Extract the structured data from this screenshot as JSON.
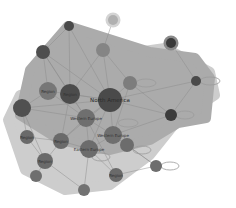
{
  "diagram": {
    "type": "network-graph",
    "colors": {
      "background": "#ffffff",
      "hull_outer": "#c9c9c9",
      "hull_inner": "#a9a9a9",
      "edge": "#8c8c8c",
      "loop": "#9a9a9a"
    },
    "hulls": [
      {
        "name": "outer-cluster",
        "points": "45,88 95,58 165,48 210,72 215,95 178,120 150,155 110,185 65,190 25,170 8,120 20,95",
        "fill": "#cdcdcd"
      },
      {
        "name": "inner-cluster",
        "points": "30,70 68,26 150,52 195,58 210,78 206,118 178,123 150,140 110,150 60,140 20,115",
        "fill": "#ababab"
      }
    ],
    "nodes": [
      {
        "id": "n1",
        "x": 113,
        "y": 20,
        "r": 5,
        "fill": "#b0b0b0",
        "ring": "#d4d4d4",
        "label": ""
      },
      {
        "id": "n2",
        "x": 171,
        "y": 43,
        "r": 5,
        "fill": "#3a3a3a",
        "ring": "#8a8a8a",
        "label": ""
      },
      {
        "id": "n3",
        "x": 69,
        "y": 26,
        "r": 5,
        "fill": "#4a4a4a",
        "ring": "",
        "label": ""
      },
      {
        "id": "n4",
        "x": 43,
        "y": 52,
        "r": 7,
        "fill": "#4e4e4e",
        "ring": "",
        "label": ""
      },
      {
        "id": "n5",
        "x": 103,
        "y": 50,
        "r": 7,
        "fill": "#858585",
        "ring": "",
        "label": ""
      },
      {
        "id": "n6",
        "x": 196,
        "y": 81,
        "r": 5,
        "fill": "#4a4a4a",
        "ring": "",
        "label": ""
      },
      {
        "id": "n7",
        "x": 48,
        "y": 91,
        "r": 9,
        "fill": "#777777",
        "ring": "",
        "label": "Region"
      },
      {
        "id": "n8",
        "x": 70,
        "y": 94,
        "r": 10,
        "fill": "#4c4c4c",
        "ring": "",
        "label": "Region"
      },
      {
        "id": "n9",
        "x": 110,
        "y": 100,
        "r": 12,
        "fill": "#4a4a4a",
        "ring": "",
        "label": "North America"
      },
      {
        "id": "n10",
        "x": 130,
        "y": 83,
        "r": 7,
        "fill": "#7d7d7d",
        "ring": "",
        "label": ""
      },
      {
        "id": "n11",
        "x": 171,
        "y": 115,
        "r": 6,
        "fill": "#3c3c3c",
        "ring": "",
        "label": ""
      },
      {
        "id": "n12",
        "x": 22,
        "y": 108,
        "r": 9,
        "fill": "#505050",
        "ring": "",
        "label": ""
      },
      {
        "id": "n13",
        "x": 86,
        "y": 118,
        "r": 9,
        "fill": "#6f6f6f",
        "ring": "",
        "label": "Western Europe"
      },
      {
        "id": "n14",
        "x": 113,
        "y": 135,
        "r": 9,
        "fill": "#6f6f6f",
        "ring": "",
        "label": "Western Europe"
      },
      {
        "id": "n15",
        "x": 27,
        "y": 137,
        "r": 7,
        "fill": "#6a6a6a",
        "ring": "",
        "label": "Region"
      },
      {
        "id": "n16",
        "x": 61,
        "y": 141,
        "r": 8,
        "fill": "#6a6a6a",
        "ring": "",
        "label": "Region"
      },
      {
        "id": "n17",
        "x": 89,
        "y": 149,
        "r": 9,
        "fill": "#6c6c6c",
        "ring": "",
        "label": "Eastern Europe"
      },
      {
        "id": "n18",
        "x": 45,
        "y": 161,
        "r": 8,
        "fill": "#6a6a6a",
        "ring": "",
        "label": "Region"
      },
      {
        "id": "n19",
        "x": 116,
        "y": 175,
        "r": 7,
        "fill": "#6a6a6a",
        "ring": "",
        "label": "Region"
      },
      {
        "id": "n20",
        "x": 156,
        "y": 166,
        "r": 6,
        "fill": "#6e6e6e",
        "ring": "",
        "label": ""
      },
      {
        "id": "n21",
        "x": 127,
        "y": 145,
        "r": 7,
        "fill": "#6c6c6c",
        "ring": "",
        "label": ""
      },
      {
        "id": "n22",
        "x": 84,
        "y": 190,
        "r": 6,
        "fill": "#727272",
        "ring": "",
        "label": ""
      },
      {
        "id": "n23",
        "x": 36,
        "y": 176,
        "r": 6,
        "fill": "#6f6f6f",
        "ring": "",
        "label": ""
      }
    ],
    "edges": [
      [
        "n1",
        "n5"
      ],
      [
        "n2",
        "n6"
      ],
      [
        "n3",
        "n4"
      ],
      [
        "n3",
        "n8"
      ],
      [
        "n4",
        "n7"
      ],
      [
        "n4",
        "n8"
      ],
      [
        "n4",
        "n9"
      ],
      [
        "n5",
        "n9"
      ],
      [
        "n5",
        "n10"
      ],
      [
        "n5",
        "n8"
      ],
      [
        "n6",
        "n9"
      ],
      [
        "n6",
        "n11"
      ],
      [
        "n7",
        "n9"
      ],
      [
        "n7",
        "n13"
      ],
      [
        "n8",
        "n9"
      ],
      [
        "n8",
        "n13"
      ],
      [
        "n9",
        "n10"
      ],
      [
        "n9",
        "n11"
      ],
      [
        "n9",
        "n13"
      ],
      [
        "n9",
        "n14"
      ],
      [
        "n9",
        "n17"
      ],
      [
        "n9",
        "n16"
      ],
      [
        "n10",
        "n14"
      ],
      [
        "n12",
        "n9"
      ],
      [
        "n12",
        "n13"
      ],
      [
        "n12",
        "n15"
      ],
      [
        "n13",
        "n14"
      ],
      [
        "n13",
        "n17"
      ],
      [
        "n13",
        "n16"
      ],
      [
        "n14",
        "n17"
      ],
      [
        "n14",
        "n21"
      ],
      [
        "n15",
        "n16"
      ],
      [
        "n15",
        "n18"
      ],
      [
        "n16",
        "n17"
      ],
      [
        "n16",
        "n18"
      ],
      [
        "n17",
        "n19"
      ],
      [
        "n17",
        "n22"
      ],
      [
        "n18",
        "n22"
      ],
      [
        "n18",
        "n23"
      ],
      [
        "n19",
        "n20"
      ],
      [
        "n21",
        "n20"
      ],
      [
        "n14",
        "n20"
      ],
      [
        "n4",
        "n13"
      ],
      [
        "n3",
        "n9"
      ],
      [
        "n11",
        "n14"
      ],
      [
        "n7",
        "n12"
      ],
      [
        "n10",
        "n11"
      ],
      [
        "n8",
        "n16"
      ],
      [
        "n13",
        "n19"
      ],
      [
        "n12",
        "n18"
      ]
    ],
    "loops": [
      {
        "node": "n6",
        "cx": 210,
        "cy": 81,
        "rx": 10,
        "ry": 4
      },
      {
        "node": "n11",
        "cx": 185,
        "cy": 115,
        "rx": 9,
        "ry": 4
      },
      {
        "node": "n20",
        "cx": 170,
        "cy": 166,
        "rx": 9,
        "ry": 4
      },
      {
        "node": "n10",
        "cx": 146,
        "cy": 83,
        "rx": 10,
        "ry": 4
      },
      {
        "node": "n14",
        "cx": 128,
        "cy": 123,
        "rx": 10,
        "ry": 4
      },
      {
        "node": "n21",
        "cx": 142,
        "cy": 150,
        "rx": 9,
        "ry": 4
      },
      {
        "node": "n17",
        "cx": 101,
        "cy": 157,
        "rx": 9,
        "ry": 4
      }
    ],
    "labels": {
      "north_america": "North America",
      "western_europe_1": "Western Europe",
      "western_europe_2": "Western Europe",
      "eastern_europe": "Eastern Europe",
      "region": "Region"
    }
  }
}
